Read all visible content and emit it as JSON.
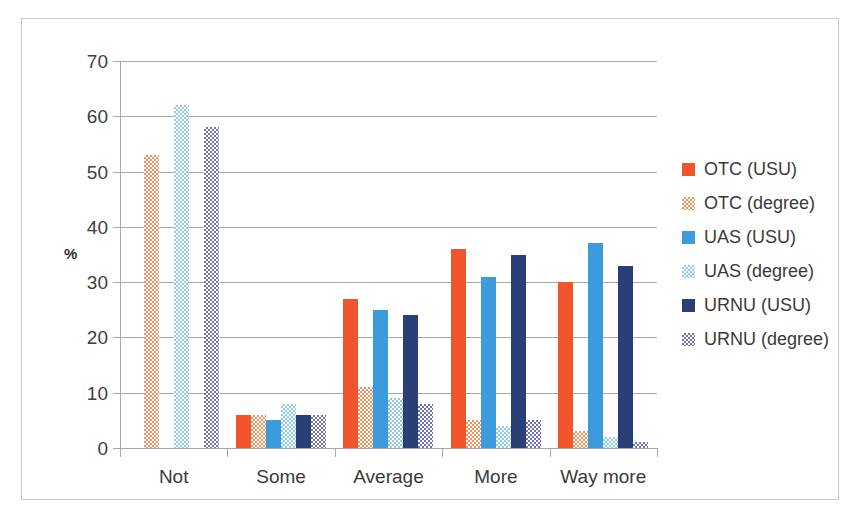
{
  "chart_data": {
    "type": "bar",
    "title": "",
    "subtitle": "",
    "xlabel": "",
    "ylabel": "%",
    "ylim": [
      0,
      70
    ],
    "ytick_step": 10,
    "yticks": [
      70,
      60,
      50,
      40,
      30,
      20,
      10,
      0
    ],
    "grid": true,
    "legend_position": "right",
    "categories": [
      "Not",
      "Some",
      "Average",
      "More",
      "Way more"
    ],
    "series": [
      {
        "name": "OTC (USU)",
        "color": "#F2552C",
        "pattern": "solid",
        "values": [
          0,
          6,
          27,
          36,
          30
        ]
      },
      {
        "name": "OTC (degree)",
        "color": "#F2905E",
        "pattern": "hatch",
        "values": [
          53,
          6,
          11,
          5,
          3
        ]
      },
      {
        "name": "UAS (USU)",
        "color": "#3C9BDD",
        "pattern": "solid",
        "values": [
          0,
          5,
          25,
          31,
          37
        ]
      },
      {
        "name": "UAS (degree)",
        "color": "#8FC9EC",
        "pattern": "hatch",
        "values": [
          62,
          8,
          9,
          4,
          2
        ]
      },
      {
        "name": "URNU (USU)",
        "color": "#2B3F77",
        "pattern": "solid",
        "values": [
          0,
          6,
          24,
          35,
          33
        ]
      },
      {
        "name": "URNU (degree)",
        "color": "#6E72AE",
        "pattern": "hatch",
        "values": [
          58,
          6,
          8,
          5,
          1
        ]
      }
    ]
  },
  "axis": {
    "y_title": "%",
    "y_tick_labels": [
      "70",
      "60",
      "50",
      "40",
      "30",
      "20",
      "10",
      "0"
    ],
    "x_tick_labels": [
      "Not",
      "Some",
      "Average",
      "More",
      "Way more"
    ]
  },
  "legend": {
    "items": [
      {
        "label": "OTC (USU)"
      },
      {
        "label": "OTC (degree)"
      },
      {
        "label": "UAS (USU)"
      },
      {
        "label": "UAS (degree)"
      },
      {
        "label": "URNU (USU)"
      },
      {
        "label": "URNU (degree)"
      }
    ]
  }
}
